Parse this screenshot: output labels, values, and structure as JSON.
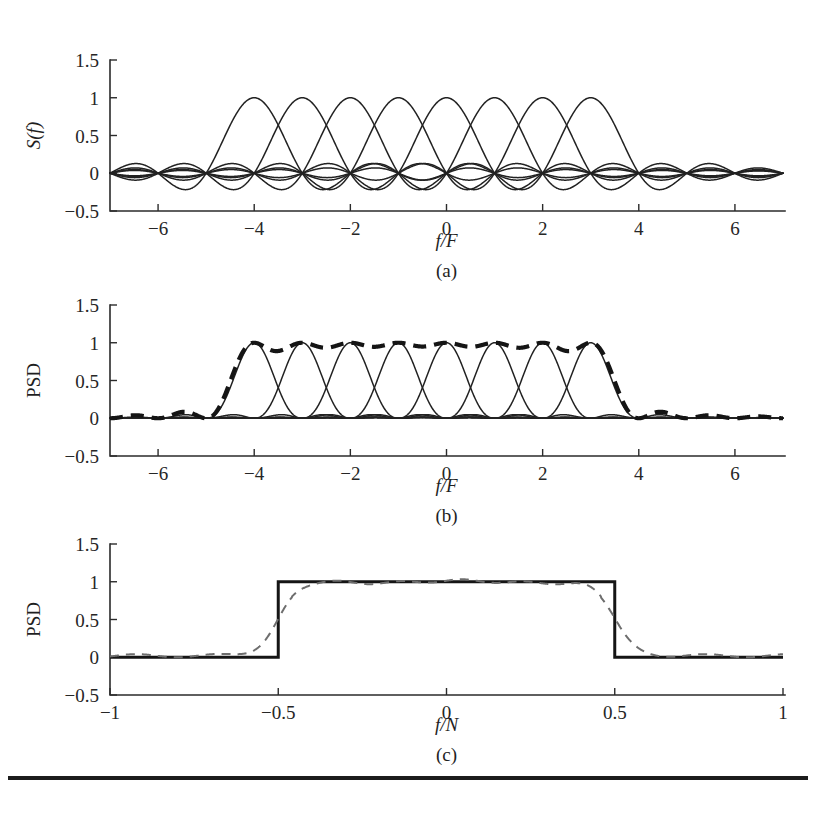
{
  "figure": {
    "background_color": "#ffffff",
    "ink_color": "#222222",
    "gray_dash_color": "#6e6e6e",
    "panel_count": 3
  },
  "panels": [
    {
      "key": "a",
      "caption": "(a)",
      "xlabel": "f/F",
      "ylabel": "S(f)",
      "ylabel_style": "italic"
    },
    {
      "key": "b",
      "caption": "(b)",
      "xlabel": "f/F",
      "ylabel": "PSD",
      "ylabel_style": "upright"
    },
    {
      "key": "c",
      "caption": "(c)",
      "xlabel": "f/N",
      "ylabel": "PSD",
      "ylabel_style": "upright"
    }
  ],
  "page_rule": {
    "present": true,
    "color": "#1c1c1c"
  },
  "chart_data": [
    {
      "type": "line",
      "panel": "a",
      "title": "",
      "xlabel": "f/F",
      "ylabel": "S(f)",
      "caption": "(a)",
      "xlim": [
        -7,
        7
      ],
      "ylim": [
        -0.5,
        1.5
      ],
      "xticks": [
        -6,
        -4,
        -2,
        0,
        2,
        4,
        6
      ],
      "xtick_labels": [
        "−6",
        "−4",
        "−2",
        "0",
        "2",
        "4",
        "6"
      ],
      "yticks": [
        -0.5,
        0,
        0.5,
        1,
        1.5
      ],
      "ytick_labels": [
        "−0.5",
        "0",
        "0.5",
        "1",
        "1.5"
      ],
      "grid": false,
      "legend": "none",
      "series_description": "Eight overlapping sinc subcarrier spectra sin(pi*(x-k))/(pi*(x-k)), subcarrier index k from -4 to 3, each peaking at amplitude 1 at its own center and crossing zero at every other integer.",
      "series": [
        {
          "name": "subcarrier -4",
          "center": -4,
          "peak": 1.0,
          "shape": "sinc"
        },
        {
          "name": "subcarrier -3",
          "center": -3,
          "peak": 1.0,
          "shape": "sinc"
        },
        {
          "name": "subcarrier -2",
          "center": -2,
          "peak": 1.0,
          "shape": "sinc"
        },
        {
          "name": "subcarrier -1",
          "center": -1,
          "peak": 1.0,
          "shape": "sinc"
        },
        {
          "name": "subcarrier 0",
          "center": 0,
          "peak": 1.0,
          "shape": "sinc"
        },
        {
          "name": "subcarrier 1",
          "center": 1,
          "peak": 1.0,
          "shape": "sinc"
        },
        {
          "name": "subcarrier 2",
          "center": 2,
          "peak": 1.0,
          "shape": "sinc"
        },
        {
          "name": "subcarrier 3",
          "center": 3,
          "peak": 1.0,
          "shape": "sinc"
        }
      ]
    },
    {
      "type": "line",
      "panel": "b",
      "title": "",
      "xlabel": "f/F",
      "ylabel": "PSD",
      "caption": "(b)",
      "xlim": [
        -7,
        7
      ],
      "ylim": [
        -0.5,
        1.5
      ],
      "xticks": [
        -6,
        -4,
        -2,
        0,
        2,
        4,
        6
      ],
      "xtick_labels": [
        "−6",
        "−4",
        "−2",
        "0",
        "2",
        "4",
        "6"
      ],
      "yticks": [
        -0.5,
        0,
        0.5,
        1,
        1.5
      ],
      "ytick_labels": [
        "−0.5",
        "0",
        "0.5",
        "1",
        "1.5"
      ],
      "grid": false,
      "legend": "none",
      "series_description": "Eight thin solid sinc-squared subcarrier power spectra (centers -4..3, peak 1) plus one thick dashed total-PSD envelope that is flat near 1 across the occupied band and near 0 outside it.",
      "series": [
        {
          "name": "subcarrier -4",
          "center": -4,
          "peak": 1.0,
          "shape": "sinc-squared",
          "style": "thin-solid"
        },
        {
          "name": "subcarrier -3",
          "center": -3,
          "peak": 1.0,
          "shape": "sinc-squared",
          "style": "thin-solid"
        },
        {
          "name": "subcarrier -2",
          "center": -2,
          "peak": 1.0,
          "shape": "sinc-squared",
          "style": "thin-solid"
        },
        {
          "name": "subcarrier -1",
          "center": -1,
          "peak": 1.0,
          "shape": "sinc-squared",
          "style": "thin-solid"
        },
        {
          "name": "subcarrier 0",
          "center": 0,
          "peak": 1.0,
          "shape": "sinc-squared",
          "style": "thin-solid"
        },
        {
          "name": "subcarrier 1",
          "center": 1,
          "peak": 1.0,
          "shape": "sinc-squared",
          "style": "thin-solid"
        },
        {
          "name": "subcarrier 2",
          "center": 2,
          "peak": 1.0,
          "shape": "sinc-squared",
          "style": "thin-solid"
        },
        {
          "name": "subcarrier 3",
          "center": 3,
          "peak": 1.0,
          "shape": "sinc-squared",
          "style": "thin-solid"
        },
        {
          "name": "total PSD envelope",
          "shape": "sum-envelope",
          "style": "thick-dashed",
          "plateau": 1.0,
          "band": [
            -4.5,
            3.5
          ],
          "floor": 0.02
        }
      ]
    },
    {
      "type": "line",
      "panel": "c",
      "title": "",
      "xlabel": "f/N",
      "ylabel": "PSD",
      "caption": "(c)",
      "xlim": [
        -1,
        1
      ],
      "ylim": [
        -0.5,
        1.5
      ],
      "xticks": [
        -1,
        -0.5,
        0,
        0.5,
        1
      ],
      "xtick_labels": [
        "−1",
        "−0.5",
        "0",
        "0.5",
        "1"
      ],
      "yticks": [
        -0.5,
        0,
        0.5,
        1,
        1.5
      ],
      "ytick_labels": [
        "−0.5",
        "0",
        "0.5",
        "1",
        "1.5"
      ],
      "grid": false,
      "legend": "none",
      "series_description": "An ideal rectangular PSD of height 1 between f/N = -0.5 and +0.5 drawn as a thick solid black line, overlaid by a gray dashed simulated PSD that rises gradually near the band edges, shows small ripples across the flat top at about 1, and decays to near 0 in the stopband.",
      "series": [
        {
          "name": "ideal rectangular PSD",
          "style": "thick-solid",
          "plateau": 1.0,
          "band": [
            -0.5,
            0.5
          ],
          "floor": 0.0
        },
        {
          "name": "simulated PSD",
          "style": "gray-dashed",
          "plateau": 1.0,
          "band": [
            -0.5,
            0.5
          ],
          "edge_rolloff": 0.1,
          "ripple_amplitude": 0.03,
          "floor": 0.02
        }
      ]
    }
  ]
}
